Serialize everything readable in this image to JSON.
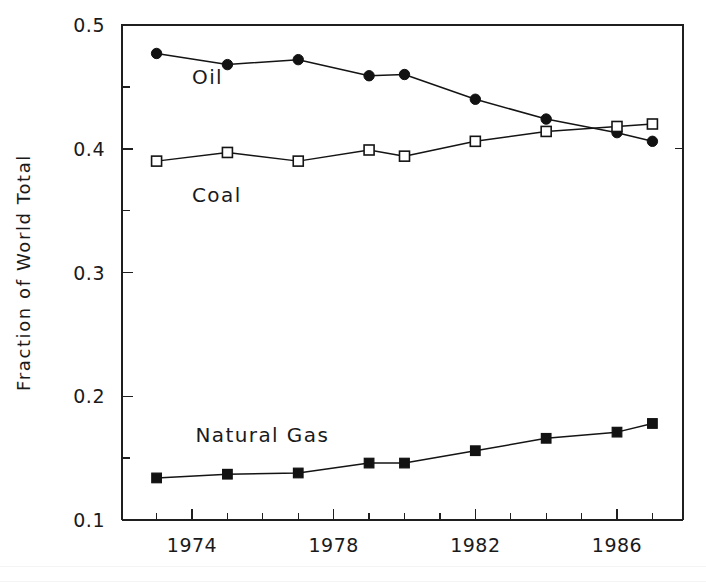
{
  "chart_data": {
    "type": "line",
    "title": "",
    "xlabel": "",
    "ylabel": "Fraction of World Total",
    "xlim": [
      1972.6,
      1987.4
    ],
    "ylim": [
      0.1,
      0.5
    ],
    "grid": false,
    "legend_position": "inline-annotations",
    "x_tick_labels": [
      "1974",
      "1978",
      "1982",
      "1986"
    ],
    "x_tick_values": [
      1974,
      1978,
      1982,
      1986
    ],
    "x_minor_tick_interval": 1,
    "y_tick_labels": [
      "0.5",
      "0.4",
      "0.3",
      "0.2",
      "0.1"
    ],
    "y_tick_values": [
      0.5,
      0.4,
      0.3,
      0.2,
      0.1
    ],
    "y_minor_tick_interval": 0.025,
    "x": [
      1973,
      1975,
      1977,
      1979,
      1980,
      1982,
      1984,
      1986,
      1987
    ],
    "series": [
      {
        "name": "Oil",
        "marker": "filled-circle",
        "values": [
          0.477,
          0.468,
          0.472,
          0.459,
          0.46,
          0.44,
          0.424,
          0.413,
          0.406
        ],
        "annotation": "Oil",
        "annotation_x": 1974.0,
        "annotation_y": 0.452
      },
      {
        "name": "Coal",
        "marker": "open-square",
        "values": [
          0.39,
          0.397,
          0.39,
          0.399,
          0.394,
          0.406,
          0.414,
          0.418,
          0.42
        ],
        "annotation": "Coal",
        "annotation_x": 1974.0,
        "annotation_y": 0.357
      },
      {
        "name": "Natural Gas",
        "marker": "filled-square",
        "values": [
          0.134,
          0.137,
          0.138,
          0.146,
          0.146,
          0.156,
          0.166,
          0.171,
          0.178
        ],
        "annotation": "Natural Gas",
        "annotation_x": 1974.1,
        "annotation_y": 0.163
      }
    ]
  },
  "colors": {
    "background": "#ffffff",
    "axis": "#1f1f1f",
    "line": "#141414",
    "marker_fill": "#121212",
    "marker_open_fill": "#ffffff",
    "text": "#1a1a1a"
  },
  "labels": {
    "y_axis_title": "Fraction of World Total",
    "annotation_oil": "Oil",
    "annotation_coal": "Coal",
    "annotation_natural_gas": "Natural Gas",
    "y_tick_0": "0.5",
    "y_tick_1": "0.4",
    "y_tick_2": "0.3",
    "y_tick_3": "0.2",
    "y_tick_4": "0.1",
    "x_tick_0": "1974",
    "x_tick_1": "1978",
    "x_tick_2": "1982",
    "x_tick_3": "1986"
  }
}
